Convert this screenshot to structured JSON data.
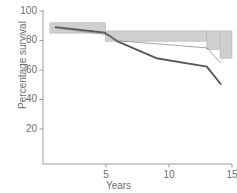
{
  "chart_data": {
    "type": "line",
    "title": "",
    "xlabel": "Years",
    "ylabel": "Percentage survival",
    "xlim": [
      0,
      15
    ],
    "ylim": [
      0,
      100
    ],
    "xticks": [
      5,
      10,
      15
    ],
    "xticklabels": [
      "5",
      "10",
      "15"
    ],
    "yticks": [
      20,
      40,
      60,
      80,
      100
    ],
    "yticklabels": [
      "20",
      "40",
      "60",
      "80",
      "100"
    ],
    "grid": false,
    "legend": "none",
    "series": [
      {
        "name": "thick-curve",
        "style": "thick-dark",
        "color": "#58585a",
        "linewidth": 1.9,
        "x": [
          1.0,
          4.9,
          6.0,
          9.0,
          13.0,
          14.1
        ],
        "y": [
          89.0,
          85.3,
          79.0,
          68.0,
          62.3,
          50.5
        ]
      },
      {
        "name": "thin-curve",
        "style": "thin-light",
        "color": "#8e8e90",
        "linewidth": 0.8,
        "x": [
          1.0,
          4.9,
          6.0,
          13.0,
          14.1
        ],
        "y": [
          88.4,
          84.2,
          79.8,
          75.0,
          64.8
        ]
      }
    ],
    "confidence_bands": [
      {
        "name": "band-1",
        "x0": 0.55,
        "x1": 4.95,
        "y0": 85.0,
        "y1": 92.0,
        "fill": "#cfcfcf"
      },
      {
        "name": "band-2",
        "x0": 4.95,
        "x1": 13.0,
        "y0": 79.5,
        "y1": 86.5,
        "fill": "#cfcfcf"
      },
      {
        "name": "band-3",
        "x0": 13.0,
        "x1": 14.0,
        "y0": 74.0,
        "y1": 86.5,
        "fill": "#cfcfcf"
      },
      {
        "name": "band-4",
        "x0": 14.05,
        "x1": 15.0,
        "y0": 68.0,
        "y1": 86.5,
        "fill": "#cfcfcf"
      }
    ],
    "axis_color": "#9a9a9a",
    "plot_background": "#ffffff"
  }
}
